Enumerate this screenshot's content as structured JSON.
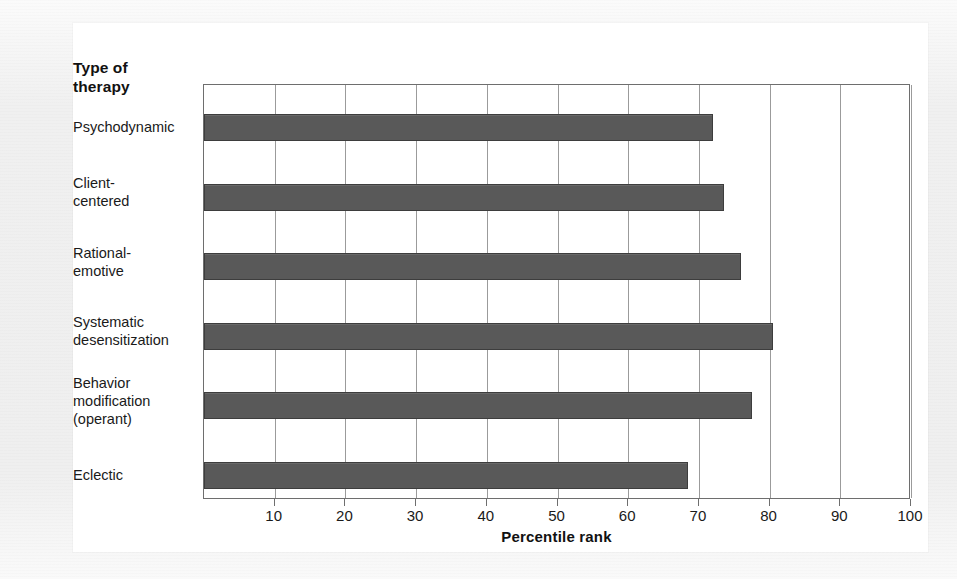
{
  "figure": {
    "y_axis_caption": "Type of\ntherapy",
    "x_axis_title": "Percentile rank"
  },
  "chart_data": {
    "type": "bar",
    "orientation": "horizontal",
    "title": "",
    "xlabel": "Percentile rank",
    "ylabel": "Type of therapy",
    "xlim": [
      0,
      100
    ],
    "xticks": [
      10,
      20,
      30,
      40,
      50,
      60,
      70,
      80,
      90,
      100
    ],
    "grid": "vertical",
    "legend": "none",
    "bar_color": "#595959",
    "plot_border_color": "#6e6e6e",
    "gridline_color": "#9b9b9b",
    "background_color": "#ffffff",
    "page_background_color": "#f0f0f0",
    "categories": [
      "Psychodynamic",
      "Client-\ncentered",
      "Rational-\nemotive",
      "Systematic\ndesensitization",
      "Behavior\nmodification\n(operant)",
      "Eclectic"
    ],
    "values": [
      72,
      73.5,
      76,
      80.5,
      77.5,
      68.5
    ],
    "ticklabels": [
      "10",
      "20",
      "30",
      "40",
      "50",
      "60",
      "70",
      "80",
      "90",
      "100"
    ]
  }
}
